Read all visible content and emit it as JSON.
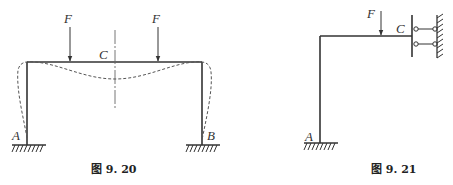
{
  "figures": [
    {
      "id": "fig-9-20",
      "caption": "图 9. 20",
      "labels": {
        "force_left": "F",
        "force_right": "F",
        "midpoint": "C",
        "support_left": "A",
        "support_right": "B"
      }
    },
    {
      "id": "fig-9-21",
      "caption": "图 9. 21",
      "labels": {
        "force": "F",
        "guided_support": "C",
        "fixed_support": "A"
      }
    }
  ],
  "colors": {
    "line": "#333333",
    "dashed": "#555555",
    "background": "#ffffff"
  }
}
